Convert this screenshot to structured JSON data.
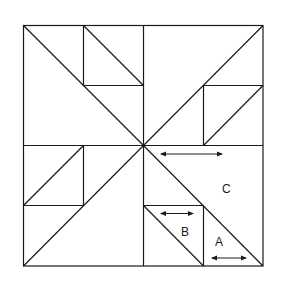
{
  "diagram": {
    "labels": {
      "a": "A",
      "b": "B",
      "c": "C"
    },
    "colors": {
      "line": "#1a1a1a",
      "background": "#ffffff"
    },
    "grain_arrows": [
      {
        "piece": "C",
        "direction": "horizontal"
      },
      {
        "piece": "B",
        "direction": "horizontal"
      },
      {
        "piece": "A",
        "direction": "horizontal"
      }
    ]
  }
}
